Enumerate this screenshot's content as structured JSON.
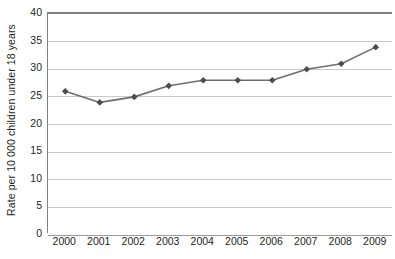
{
  "chart_data": {
    "type": "line",
    "title": "",
    "xlabel": "",
    "ylabel": "Rate per 10 000 children under 18 years",
    "categories": [
      "2000",
      "2001",
      "2002",
      "2003",
      "2004",
      "2005",
      "2006",
      "2007",
      "2008",
      "2009"
    ],
    "values": [
      26,
      24,
      25,
      27,
      28,
      28,
      28,
      30,
      31,
      34
    ],
    "series": [
      {
        "name": "Rate",
        "values": [
          26,
          24,
          25,
          27,
          28,
          28,
          28,
          30,
          31,
          34
        ]
      }
    ],
    "ylim": [
      0,
      40
    ],
    "yticks": [
      0,
      5,
      10,
      15,
      20,
      25,
      30,
      35,
      40
    ],
    "ytick_labels": [
      "0",
      "5",
      "10",
      "15",
      "20",
      "25",
      "30",
      "35",
      "40"
    ],
    "xtick_labels": [
      "2000",
      "2001",
      "2002",
      "2003",
      "2004",
      "2005",
      "2006",
      "2007",
      "2008",
      "2009"
    ],
    "grid": true,
    "legend": "none",
    "marker": "diamond",
    "colors": {
      "line": "#6e6e6e",
      "marker": "#4d4d4d",
      "gridline": "#c9c9c9",
      "axis": "#808080",
      "text": "#231f20",
      "background": "#ffffff"
    }
  }
}
